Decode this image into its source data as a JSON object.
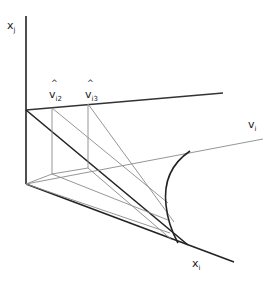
{
  "diagram": {
    "labels": {
      "xj": {
        "base": "x",
        "sub": "j"
      },
      "vi2": {
        "base": "v",
        "sub": "i2",
        "hat": "^"
      },
      "vi3": {
        "base": "v",
        "sub": "i3",
        "hat": "^"
      },
      "vi": {
        "base": "v",
        "sub": "i"
      },
      "xi": {
        "base": "x",
        "sub": "i"
      }
    },
    "colors": {
      "heavy": "#222222",
      "light": "#8a8a8a",
      "medium": "#555555"
    }
  }
}
